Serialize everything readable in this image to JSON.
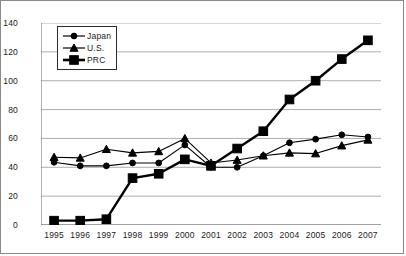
{
  "chart_data": {
    "type": "line",
    "title": "",
    "xlabel": "",
    "ylabel": "",
    "categories": [
      "1995",
      "1996",
      "1997",
      "1998",
      "1999",
      "2000",
      "2001",
      "2002",
      "2003",
      "2004",
      "2005",
      "2006",
      "2007"
    ],
    "x": [
      1995,
      1996,
      1997,
      1998,
      1999,
      2000,
      2001,
      2002,
      2003,
      2004,
      2005,
      2006,
      2007
    ],
    "series": [
      {
        "name": "Japan",
        "marker": "circle",
        "color": "#000000",
        "values": [
          43.5,
          41,
          41,
          43,
          43,
          55.5,
          40,
          40,
          48,
          57,
          59.5,
          62.5,
          61
        ]
      },
      {
        "name": "U.S.",
        "marker": "triangle",
        "color": "#000000",
        "values": [
          47,
          46.5,
          52.5,
          50,
          51,
          60,
          43,
          45,
          48,
          50,
          49.5,
          55,
          59
        ]
      },
      {
        "name": "PRC",
        "marker": "square",
        "color": "#000000",
        "values": [
          3,
          3,
          4,
          32.5,
          35.5,
          45.5,
          41,
          53,
          65,
          87,
          100,
          115,
          128
        ]
      }
    ],
    "ylim": [
      0,
      140
    ],
    "yticks": [
      0,
      20,
      40,
      60,
      80,
      100,
      120,
      140
    ],
    "ytick_labels": [
      "0",
      "20",
      "40",
      "60",
      "80",
      "100",
      "120",
      "140"
    ],
    "grid": "horizontal",
    "legend_position": "upper-left",
    "legend_entries": [
      "Japan",
      "U.S.",
      "PRC"
    ]
  },
  "axis": {
    "gridline_color": "#999999",
    "axis_color": "#6b6b6b",
    "text_color": "#1a1a1a"
  },
  "frame": {
    "border_color": "#8a8a8a",
    "background": "#ffffff"
  }
}
